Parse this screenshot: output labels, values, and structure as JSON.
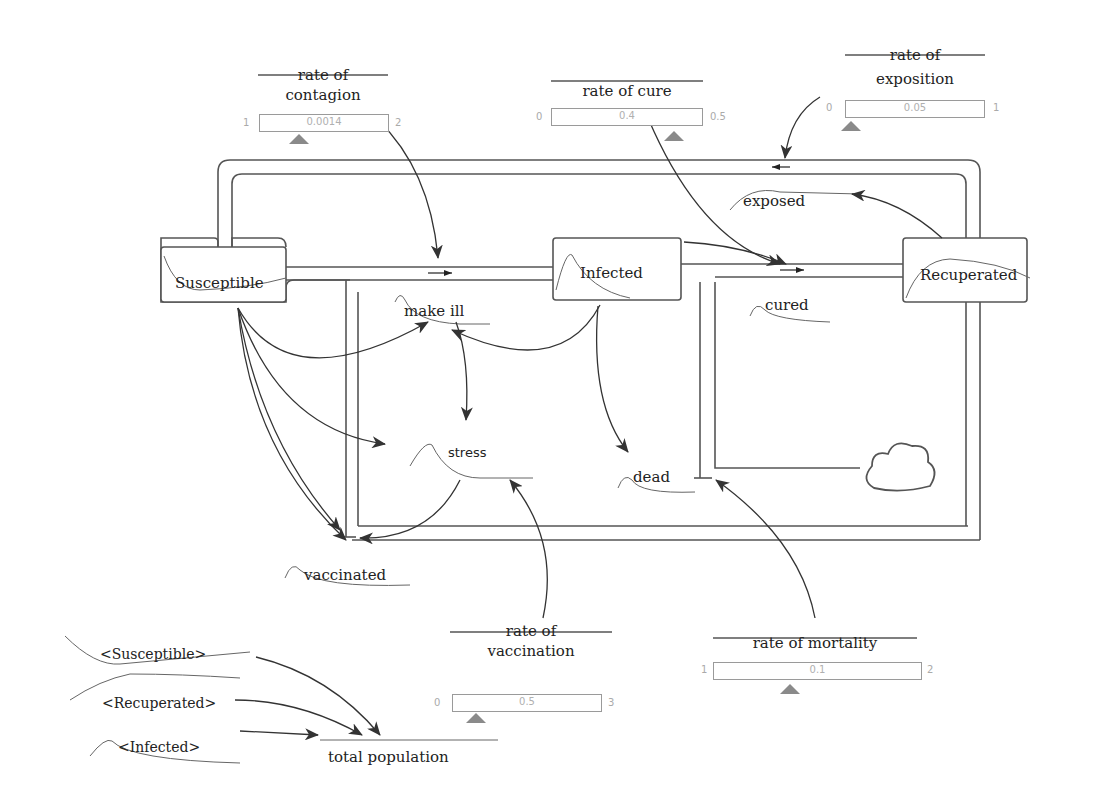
{
  "diagram": {
    "type": "stock-and-flow",
    "stocks": [
      {
        "id": "susceptible",
        "label": "Susceptible"
      },
      {
        "id": "infected",
        "label": "Infected"
      },
      {
        "id": "recuperated",
        "label": "Recuperated"
      }
    ],
    "flows": [
      {
        "id": "make_ill",
        "label": "make ill"
      },
      {
        "id": "cured",
        "label": "cured"
      },
      {
        "id": "exposed",
        "label": "exposed"
      },
      {
        "id": "vaccinated",
        "label": "vaccinated"
      },
      {
        "id": "dead",
        "label": "dead"
      }
    ],
    "variables": [
      {
        "id": "stress",
        "label": "stress"
      },
      {
        "id": "total_population",
        "label": "total population"
      }
    ],
    "shadow_variables": [
      {
        "id": "shadow_susceptible",
        "label": "<Susceptible>"
      },
      {
        "id": "shadow_recuperated",
        "label": "<Recuperated>"
      },
      {
        "id": "shadow_infected",
        "label": "<Infected>"
      }
    ],
    "parameters": [
      {
        "id": "rate_of_contagion",
        "label_line1": "rate of",
        "label_line2": "contagion",
        "min": "1",
        "max": "2",
        "value": "0.0014"
      },
      {
        "id": "rate_of_cure",
        "label_line1": "rate of cure",
        "label_line2": "",
        "min": "0",
        "max": "0.5",
        "value": "0.4"
      },
      {
        "id": "rate_of_exposition",
        "label_line1": "rate of",
        "label_line2": "exposition",
        "min": "0",
        "max": "1",
        "value": "0.05"
      },
      {
        "id": "rate_of_vaccination",
        "label_line1": "rate of",
        "label_line2": "vaccination",
        "min": "0",
        "max": "3",
        "value": "0.5"
      },
      {
        "id": "rate_of_mortality",
        "label_line1": "rate of mortality",
        "label_line2": "",
        "min": "1",
        "max": "2",
        "value": "0.1"
      }
    ],
    "cloud": {
      "id": "sink",
      "label": "cloud"
    },
    "colors": {
      "line": "#444444",
      "pipe": "#555555",
      "slider_border": "#9a9a9a",
      "slider_text": "#b0b0b0",
      "thumb": "#8a8a8a"
    }
  }
}
